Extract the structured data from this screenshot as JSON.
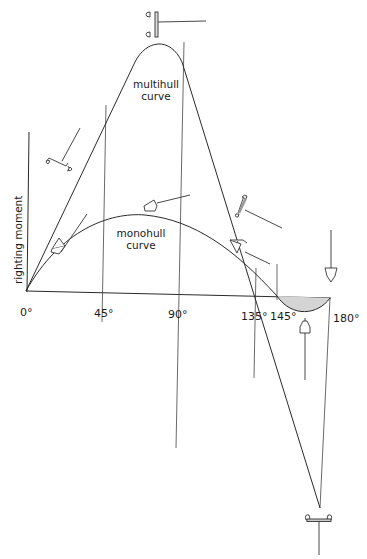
{
  "diagram": {
    "type": "righting-moment-curves",
    "y_axis_label": "righting moment",
    "x_tick_labels": [
      "0°",
      "45°",
      "90°",
      "135°",
      "145°",
      "180°"
    ],
    "curves": [
      {
        "name": "multihull",
        "label_line1": "multihull",
        "label_line2": "curve",
        "peak_angle_approx": "~80°"
      },
      {
        "name": "monohull",
        "label_line1": "monohull",
        "label_line2": "curve",
        "peak_angle_approx": "~70°",
        "vanishing_stability_angle": "145°",
        "negative_region_shaded": true
      }
    ],
    "colors": {
      "line": "#2a2a2a",
      "shade": "#d4d4d4",
      "background": "#ffffff"
    },
    "icons": [
      "multihull-upright-top-icon",
      "multihull-heeled-icon",
      "multihull-capsized-bottom-icon",
      "multihull-knockdown-icon",
      "monohull-heeled-small-icon",
      "monohull-heeled-mid-icon",
      "monohull-heeled-large-icon",
      "monohull-inverted-icon",
      "monohull-upright-icon"
    ]
  }
}
